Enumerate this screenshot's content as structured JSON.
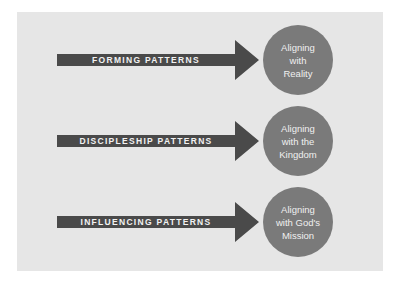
{
  "rows": [
    {
      "pattern": "FORMING PATTERNS",
      "alignment": "Aligning\nwith\nReality"
    },
    {
      "pattern": "DISCIPLESHIP PATTERNS",
      "alignment": "Aligning\nwith the\nKingdom"
    },
    {
      "pattern": "INFLUENCING PATTERNS",
      "alignment": "Aligning\nwith God's\nMission"
    }
  ],
  "colors": {
    "panel": "#e6e6e6",
    "arrow": "#4a4a4a",
    "circle": "#7a7a7a"
  }
}
